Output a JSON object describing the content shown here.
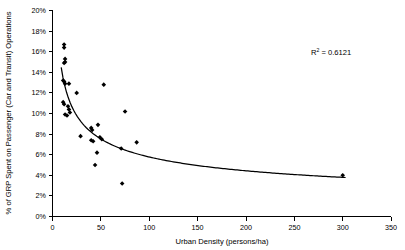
{
  "chart_data": {
    "type": "scatter",
    "title": "",
    "xlabel": "Urban Density (persons/ha)",
    "ylabel": "% of GRP Spent on Passenger (Car and Transit) Operations",
    "xlim": [
      0,
      350
    ],
    "ylim": [
      0,
      20
    ],
    "xticks": [
      0,
      50,
      100,
      150,
      200,
      250,
      300,
      350
    ],
    "xtick_labels": [
      "0",
      "50",
      "100",
      "150",
      "200",
      "250",
      "300",
      "350"
    ],
    "yticks": [
      0,
      2,
      4,
      6,
      8,
      10,
      12,
      14,
      16,
      18,
      20
    ],
    "ytick_labels": [
      "0%",
      "2%",
      "4%",
      "6%",
      "8%",
      "10%",
      "12%",
      "14%",
      "16%",
      "18%",
      "20%"
    ],
    "grid": false,
    "legend": null,
    "marker": "diamond",
    "marker_color": "#000000",
    "points": [
      {
        "x": 12,
        "y": 16.7
      },
      {
        "x": 12,
        "y": 16.4
      },
      {
        "x": 13,
        "y": 15.3
      },
      {
        "x": 13,
        "y": 15.0
      },
      {
        "x": 12,
        "y": 14.9
      },
      {
        "x": 11,
        "y": 13.2
      },
      {
        "x": 12,
        "y": 13.1
      },
      {
        "x": 13,
        "y": 12.9
      },
      {
        "x": 17,
        "y": 12.9
      },
      {
        "x": 25,
        "y": 12.0
      },
      {
        "x": 53,
        "y": 12.8
      },
      {
        "x": 11,
        "y": 11.1
      },
      {
        "x": 12,
        "y": 10.9
      },
      {
        "x": 16,
        "y": 10.7
      },
      {
        "x": 17,
        "y": 10.4
      },
      {
        "x": 18,
        "y": 10.1
      },
      {
        "x": 13,
        "y": 9.9
      },
      {
        "x": 15,
        "y": 9.8
      },
      {
        "x": 75,
        "y": 10.2
      },
      {
        "x": 29,
        "y": 7.8
      },
      {
        "x": 40,
        "y": 8.6
      },
      {
        "x": 41,
        "y": 8.4
      },
      {
        "x": 47,
        "y": 8.9
      },
      {
        "x": 40,
        "y": 7.4
      },
      {
        "x": 42,
        "y": 7.3
      },
      {
        "x": 49,
        "y": 7.7
      },
      {
        "x": 51,
        "y": 7.5
      },
      {
        "x": 87,
        "y": 7.2
      },
      {
        "x": 46,
        "y": 6.2
      },
      {
        "x": 71,
        "y": 6.6
      },
      {
        "x": 44,
        "y": 5.0
      },
      {
        "x": 300,
        "y": 4.0
      },
      {
        "x": 72,
        "y": 3.2
      }
    ],
    "trendline": {
      "type": "power",
      "label": "R² = 0.6121",
      "r_squared": 0.6121,
      "annotation_prefix": "R",
      "annotation_exponent": "2",
      "annotation_suffix": " = 0.6121"
    }
  },
  "axes": {
    "x_axis_name": "x-axis",
    "y_axis_name": "y-axis"
  }
}
